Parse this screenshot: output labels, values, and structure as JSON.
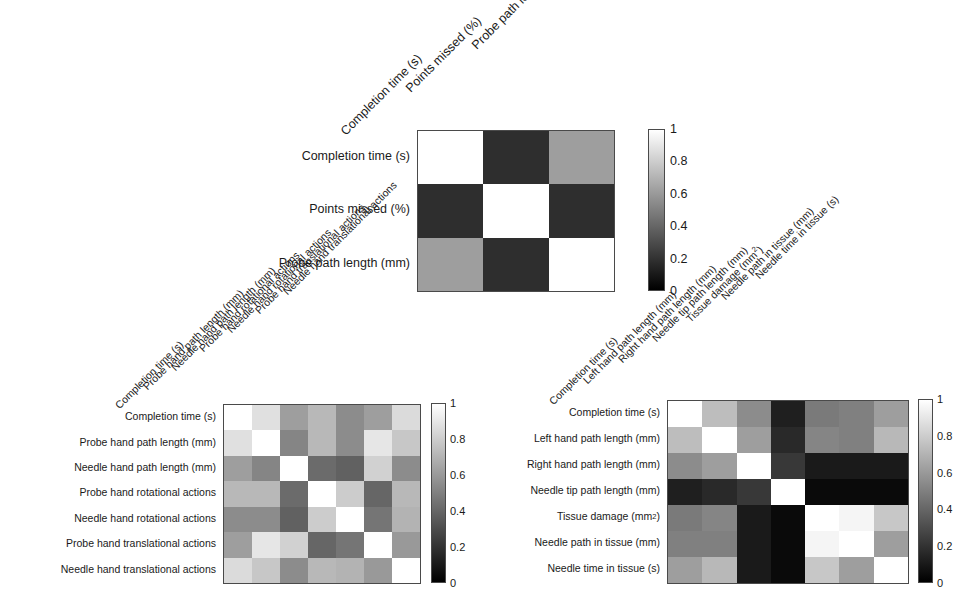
{
  "figure": {
    "type": "correlation-matrix-figure",
    "panel_count": 3,
    "colormap": "grayscale",
    "colormap_low_color": "#000000",
    "colormap_high_color": "#ffffff"
  },
  "colorbar": {
    "ticks": [
      "1",
      "0.8",
      "0.6",
      "0.4",
      "0.2",
      "0"
    ],
    "min": 0,
    "max": 1
  },
  "chart_data": [
    {
      "id": "panel-top",
      "type": "heatmap",
      "title": "",
      "xlabel": "",
      "ylabel": "",
      "grid": false,
      "legend_position": "right",
      "colorbar_label": "",
      "zlim": [
        0,
        1
      ],
      "colorbar_ticks": [
        0,
        0.2,
        0.4,
        0.6,
        0.8,
        1
      ],
      "x_categories": [
        "Completion time (s)",
        "Points missed (%)",
        "Probe path length (mm)"
      ],
      "y_categories": [
        "Completion time (s)",
        "Points missed (%)",
        "Probe path length (mm)"
      ],
      "values": [
        [
          1.0,
          0.18,
          0.62
        ],
        [
          0.18,
          1.0,
          0.18
        ],
        [
          0.62,
          0.18,
          1.0
        ]
      ]
    },
    {
      "id": "panel-bottom-left",
      "type": "heatmap",
      "title": "",
      "xlabel": "",
      "ylabel": "",
      "grid": false,
      "legend_position": "right",
      "colorbar_label": "",
      "zlim": [
        0,
        1
      ],
      "colorbar_ticks": [
        0,
        0.2,
        0.4,
        0.6,
        0.8,
        1
      ],
      "x_categories": [
        "Completion time (s)",
        "Probe hand path length (mm)",
        "Needle hand path length (mm)",
        "Probe hand rotational actions",
        "Needle hand rotational actions",
        "Probe hand translational actions",
        "Needle hand translational actions"
      ],
      "y_categories": [
        "Completion time (s)",
        "Probe hand path length (mm)",
        "Needle hand path length (mm)",
        "Probe hand rotational actions",
        "Needle hand rotational actions",
        "Probe hand translational actions",
        "Needle hand translational actions"
      ],
      "values": [
        [
          1.0,
          0.88,
          0.62,
          0.72,
          0.55,
          0.62,
          0.86
        ],
        [
          0.88,
          1.0,
          0.52,
          0.72,
          0.55,
          0.9,
          0.78
        ],
        [
          0.62,
          0.52,
          1.0,
          0.42,
          0.38,
          0.82,
          0.55
        ],
        [
          0.72,
          0.72,
          0.42,
          1.0,
          0.8,
          0.4,
          0.72
        ],
        [
          0.55,
          0.55,
          0.38,
          0.8,
          1.0,
          0.46,
          0.7
        ],
        [
          0.62,
          0.9,
          0.82,
          0.4,
          0.46,
          1.0,
          0.6
        ],
        [
          0.86,
          0.78,
          0.55,
          0.72,
          0.7,
          0.6,
          1.0
        ]
      ]
    },
    {
      "id": "panel-bottom-right",
      "type": "heatmap",
      "title": "",
      "xlabel": "",
      "ylabel": "",
      "grid": false,
      "legend_position": "right",
      "colorbar_label": "",
      "zlim": [
        0,
        1
      ],
      "colorbar_ticks": [
        0,
        0.2,
        0.4,
        0.6,
        0.8,
        1
      ],
      "x_categories": [
        "Completion time (s)",
        "Left hand path length (mm)",
        "Right hand path length (mm)",
        "Needle tip path length (mm)",
        "Tissue damage (mm2)",
        "Needle path in tissue (mm)",
        "Needle time in tissue (s)"
      ],
      "y_categories": [
        "Completion time (s)",
        "Left hand path length (mm)",
        "Right hand path length (mm)",
        "Needle tip path length (mm)",
        "Tissue damage (mm2)",
        "Needle path in tissue (mm)",
        "Needle time in tissue (s)"
      ],
      "values": [
        [
          1.0,
          0.74,
          0.55,
          0.12,
          0.48,
          0.5,
          0.62
        ],
        [
          0.74,
          1.0,
          0.62,
          0.16,
          0.52,
          0.5,
          0.72
        ],
        [
          0.55,
          0.62,
          1.0,
          0.22,
          0.1,
          0.1,
          0.1
        ],
        [
          0.12,
          0.16,
          0.22,
          1.0,
          0.04,
          0.04,
          0.04
        ],
        [
          0.48,
          0.52,
          0.1,
          0.04,
          1.0,
          0.96,
          0.78
        ],
        [
          0.5,
          0.5,
          0.1,
          0.04,
          0.96,
          1.0,
          0.62
        ],
        [
          0.62,
          0.72,
          0.1,
          0.04,
          0.78,
          0.62,
          1.0
        ]
      ]
    }
  ],
  "panels": {
    "top": {
      "row_labels": [
        "Completion time (s)",
        "Points missed (%)",
        "Probe path length (mm)"
      ],
      "col_labels": [
        "Completion time (s)",
        "Points missed (%)",
        "Probe path length (mm)"
      ]
    },
    "bottom_left": {
      "row_labels": [
        "Completion time (s)",
        "Probe hand path length (mm)",
        "Needle hand path length (mm)",
        "Probe hand rotational actions",
        "Needle hand rotational actions",
        "Probe hand translational actions",
        "Needle hand translational actions"
      ],
      "col_labels": [
        "Completion time (s)",
        "Probe hand path length (mm)",
        "Needle hand path length (mm)",
        "Probe hand rotational actions",
        "Needle hand rotational actions",
        "Probe hand translational actions",
        "Needle hand translational actions"
      ]
    },
    "bottom_right": {
      "row_labels": [
        "Completion time (s)",
        "Left hand path length (mm)",
        "Right hand path length (mm)",
        "Needle tip path length (mm)",
        "Tissue damage (mm²)",
        "Needle path in tissue (mm)",
        "Needle time in tissue (s)"
      ],
      "col_labels": [
        "Completion time (s)",
        "Left hand path length (mm)",
        "Right hand path length (mm)",
        "Needle tip path length (mm)",
        "Tissue damage (mm²)",
        "Needle path in tissue (mm)",
        "Needle time in tissue (s)"
      ]
    }
  }
}
